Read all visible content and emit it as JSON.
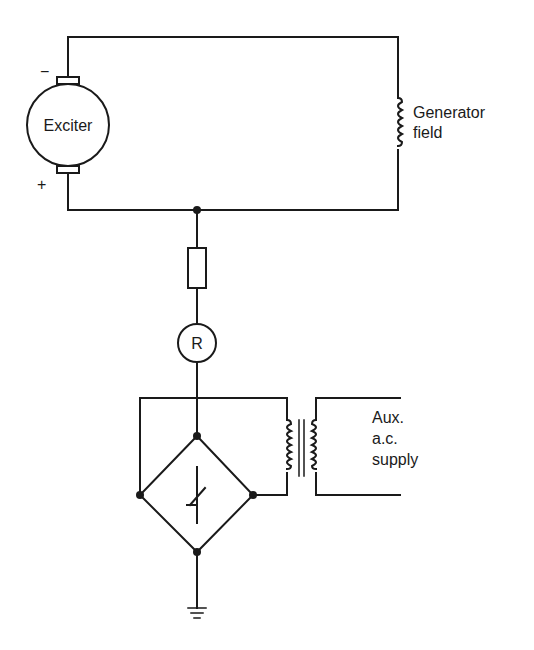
{
  "diagram": {
    "labels": {
      "exciter": "Exciter",
      "exciter_neg": "−",
      "exciter_pos": "+",
      "generator_field_line1": "Generator",
      "generator_field_line2": "field",
      "relay": "R",
      "aux_line1": "Aux.",
      "aux_line2": "a.c.",
      "aux_line3": "supply"
    },
    "components": [
      {
        "id": "exciter",
        "type": "dc-machine"
      },
      {
        "id": "generator-field",
        "type": "inductor"
      },
      {
        "id": "resistor",
        "type": "resistor"
      },
      {
        "id": "relay",
        "type": "relay-coil",
        "label": "R"
      },
      {
        "id": "bridge",
        "type": "rectifier-bridge-with-thyristor"
      },
      {
        "id": "transformer",
        "type": "transformer"
      },
      {
        "id": "ground",
        "type": "earth"
      }
    ],
    "colors": {
      "line": "#1a1a1a",
      "background": "#ffffff"
    }
  }
}
